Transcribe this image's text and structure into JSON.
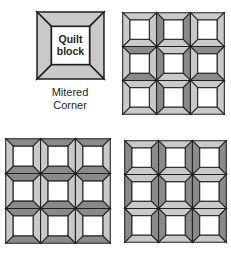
{
  "figure": {
    "background": "#ffffff"
  },
  "palette": {
    "light_gray": "#c9c9c9",
    "dark_gray": "#8a8a8a",
    "center_white": "#ffffff",
    "seam_line": "#231f20",
    "text": "#231f20"
  },
  "single_block": {
    "center_text_line1": "Quilt",
    "center_text_line2": "block",
    "caption_line1": "Mitered",
    "caption_line2": "Corner",
    "panels": {
      "top": "light",
      "right": "light",
      "bottom": "light",
      "left": "light"
    }
  },
  "grids": [
    {
      "id": "top-right",
      "name": "checkerboard-layout",
      "rows": 3,
      "cols": 3,
      "blocks": [
        {
          "row": 0,
          "col": 0,
          "top": "light",
          "right": "light",
          "bottom": "light",
          "left": "light"
        },
        {
          "row": 0,
          "col": 1,
          "top": "light",
          "right": "dark",
          "bottom": "light",
          "left": "dark"
        },
        {
          "row": 0,
          "col": 2,
          "top": "light",
          "right": "light",
          "bottom": "light",
          "left": "light"
        },
        {
          "row": 1,
          "col": 0,
          "top": "dark",
          "right": "light",
          "bottom": "dark",
          "left": "light"
        },
        {
          "row": 1,
          "col": 1,
          "top": "light",
          "right": "dark",
          "bottom": "light",
          "left": "dark"
        },
        {
          "row": 1,
          "col": 2,
          "top": "dark",
          "right": "light",
          "bottom": "dark",
          "left": "light"
        },
        {
          "row": 2,
          "col": 0,
          "top": "light",
          "right": "light",
          "bottom": "light",
          "left": "light"
        },
        {
          "row": 2,
          "col": 1,
          "top": "light",
          "right": "dark",
          "bottom": "light",
          "left": "dark"
        },
        {
          "row": 2,
          "col": 2,
          "top": "light",
          "right": "light",
          "bottom": "light",
          "left": "light"
        }
      ]
    },
    {
      "id": "bottom-left",
      "name": "horizontal-bands-layout",
      "rows": 3,
      "cols": 3,
      "blocks": [
        {
          "row": 0,
          "col": 0,
          "top": "dark",
          "right": "light",
          "bottom": "dark",
          "left": "light"
        },
        {
          "row": 0,
          "col": 1,
          "top": "dark",
          "right": "light",
          "bottom": "dark",
          "left": "light"
        },
        {
          "row": 0,
          "col": 2,
          "top": "dark",
          "right": "light",
          "bottom": "dark",
          "left": "light"
        },
        {
          "row": 1,
          "col": 0,
          "top": "dark",
          "right": "light",
          "bottom": "dark",
          "left": "light"
        },
        {
          "row": 1,
          "col": 1,
          "top": "dark",
          "right": "light",
          "bottom": "dark",
          "left": "light"
        },
        {
          "row": 1,
          "col": 2,
          "top": "dark",
          "right": "light",
          "bottom": "dark",
          "left": "light"
        },
        {
          "row": 2,
          "col": 0,
          "top": "dark",
          "right": "light",
          "bottom": "dark",
          "left": "light"
        },
        {
          "row": 2,
          "col": 1,
          "top": "dark",
          "right": "light",
          "bottom": "dark",
          "left": "light"
        },
        {
          "row": 2,
          "col": 2,
          "top": "dark",
          "right": "light",
          "bottom": "dark",
          "left": "light"
        }
      ]
    },
    {
      "id": "bottom-right",
      "name": "vertical-bands-layout",
      "rows": 3,
      "cols": 3,
      "blocks": [
        {
          "row": 0,
          "col": 0,
          "top": "light",
          "right": "dark",
          "bottom": "light",
          "left": "dark"
        },
        {
          "row": 0,
          "col": 1,
          "top": "light",
          "right": "dark",
          "bottom": "light",
          "left": "dark"
        },
        {
          "row": 0,
          "col": 2,
          "top": "light",
          "right": "dark",
          "bottom": "light",
          "left": "dark"
        },
        {
          "row": 1,
          "col": 0,
          "top": "light",
          "right": "dark",
          "bottom": "light",
          "left": "dark"
        },
        {
          "row": 1,
          "col": 1,
          "top": "light",
          "right": "dark",
          "bottom": "light",
          "left": "dark"
        },
        {
          "row": 1,
          "col": 2,
          "top": "light",
          "right": "dark",
          "bottom": "light",
          "left": "dark"
        },
        {
          "row": 2,
          "col": 0,
          "top": "light",
          "right": "dark",
          "bottom": "light",
          "left": "dark"
        },
        {
          "row": 2,
          "col": 1,
          "top": "light",
          "right": "dark",
          "bottom": "light",
          "left": "dark"
        },
        {
          "row": 2,
          "col": 2,
          "top": "light",
          "right": "dark",
          "bottom": "light",
          "left": "dark"
        }
      ]
    }
  ]
}
